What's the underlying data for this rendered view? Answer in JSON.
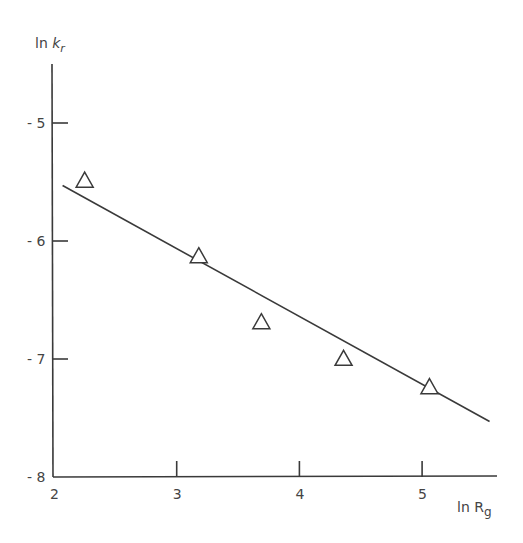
{
  "chart_data": {
    "type": "scatter",
    "title": "",
    "xlabel": "ln R",
    "xlabel_subscript": "g",
    "ylabel": "ln ",
    "ylabel_var": "k",
    "ylabel_subscript": "r",
    "xlim": [
      2,
      5.6
    ],
    "ylim": [
      -8,
      -4.5
    ],
    "x_ticks": [
      2,
      3,
      4,
      5
    ],
    "x_tick_labels": [
      "2",
      "3",
      "4",
      "5"
    ],
    "y_ticks": [
      -5,
      -6,
      -7,
      -8
    ],
    "y_tick_labels": [
      "- 5",
      "- 6",
      "- 7",
      "- 8"
    ],
    "grid": false,
    "legend": null,
    "series": [
      {
        "name": "data",
        "marker": "open-triangle",
        "x": [
          2.25,
          3.18,
          3.69,
          4.36,
          5.06
        ],
        "y": [
          -5.48,
          -6.12,
          -6.68,
          -6.99,
          -7.23
        ]
      },
      {
        "name": "linear fit",
        "style": "line",
        "x": [
          2.07,
          5.55
        ],
        "y": [
          -5.53,
          -7.53
        ]
      }
    ]
  },
  "colors": {
    "axis": "#3a3a3a",
    "marker_stroke": "#3a3a3a",
    "line": "#3a3a3a",
    "background": "#ffffff"
  }
}
